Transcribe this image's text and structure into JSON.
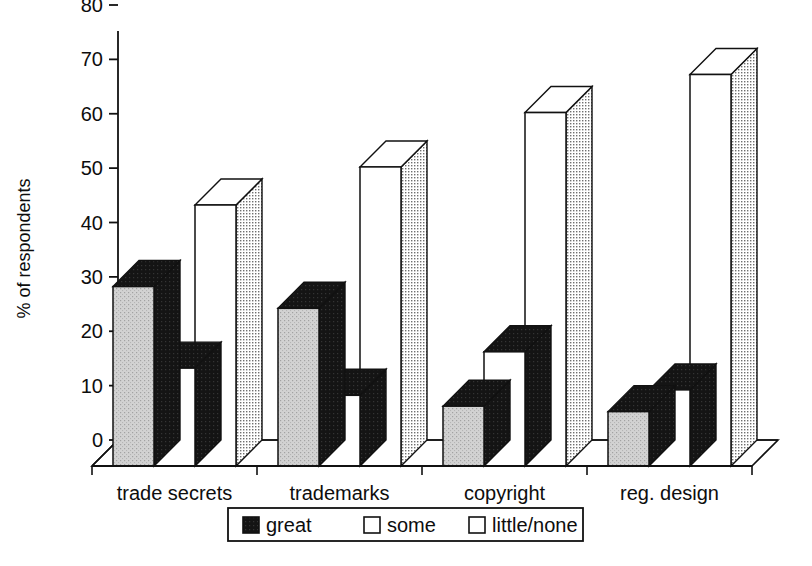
{
  "chart_data": {
    "type": "bar",
    "title": "",
    "subtitle": "",
    "xlabel": "",
    "ylabel": "% of respondents",
    "ylim": [
      0,
      80
    ],
    "yticks": [
      0,
      10,
      20,
      30,
      40,
      50,
      60,
      70,
      80
    ],
    "ytick_labels": [
      "0",
      "10",
      "20",
      "30",
      "40",
      "50",
      "60",
      "70",
      "80"
    ],
    "grid": false,
    "legend_position": "bottom",
    "style": "3d-bars",
    "categories": [
      "trade secrets",
      "trademarks",
      "copyright",
      "reg. design"
    ],
    "series": [
      {
        "name": "great",
        "values": [
          33,
          29,
          11,
          10
        ]
      },
      {
        "name": "some",
        "values": [
          18,
          13,
          21,
          14
        ]
      },
      {
        "name": "little/none",
        "values": [
          48,
          55,
          65,
          72
        ]
      }
    ],
    "annotations": []
  },
  "legend": {
    "items": [
      {
        "label": "great",
        "swatch": "dark"
      },
      {
        "label": "some",
        "swatch": "white"
      },
      {
        "label": "little/none",
        "swatch": "white"
      }
    ]
  },
  "colors": {
    "great_front": "#c9c9c9",
    "great_top": "#111111",
    "great_side": "#1a1a1a",
    "some_front": "#ffffff",
    "some_top": "#111111",
    "some_side": "#1a1a1a",
    "little_front": "#ffffff",
    "little_top": "#ffffff",
    "little_side": "#b4b4b4",
    "axis": "#111111",
    "floor": "#ffffff",
    "text": "#0d0d0d"
  }
}
